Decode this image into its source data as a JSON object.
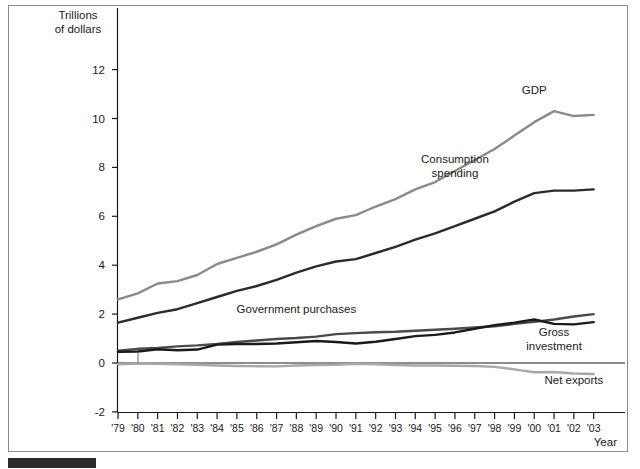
{
  "figure": {
    "axis_title_line1": "Trillions",
    "axis_title_line2": "of dollars",
    "xlabel": "Year",
    "frame_color": "#8c8c8c",
    "source_bar_color": "#2b2b2b"
  },
  "chart_data": {
    "type": "line",
    "title": "",
    "subtitle": "",
    "xlabel": "Year",
    "ylabel": "Trillions of dollars",
    "ylim": [
      -2,
      13
    ],
    "xlim": [
      "'79",
      "'03"
    ],
    "ytick_labels": [
      "12",
      "10",
      "8",
      "6",
      "4",
      "2",
      "0",
      "-2"
    ],
    "ytick_values": [
      12,
      10,
      8,
      6,
      4,
      2,
      0,
      -2
    ],
    "grid": false,
    "legend": "inline-annotations",
    "x": [
      "'79",
      "'80",
      "'81",
      "'82",
      "'83",
      "'84",
      "'85",
      "'86",
      "'87",
      "'88",
      "'89",
      "'90",
      "'91",
      "'92",
      "'93",
      "'94",
      "'95",
      "'96",
      "'97",
      "'98",
      "'99",
      "'00",
      "'01",
      "'02",
      "'03"
    ],
    "series": [
      {
        "name": "GDP",
        "color": "#8a8a8a",
        "label": "GDP",
        "values": [
          2.6,
          2.85,
          3.25,
          3.35,
          3.6,
          4.05,
          4.3,
          4.55,
          4.85,
          5.25,
          5.6,
          5.9,
          6.05,
          6.4,
          6.7,
          7.1,
          7.4,
          7.85,
          8.3,
          8.75,
          9.3,
          9.85,
          10.3,
          10.1,
          10.15
        ],
        "units": "trillions of dollars"
      },
      {
        "name": "Consumption spending",
        "color": "#2b2b2b",
        "label": "Consumption\nspending",
        "values": [
          1.65,
          1.85,
          2.05,
          2.2,
          2.45,
          2.7,
          2.95,
          3.15,
          3.4,
          3.7,
          3.95,
          4.15,
          4.25,
          4.5,
          4.75,
          5.05,
          5.3,
          5.6,
          5.9,
          6.2,
          6.6,
          6.95,
          7.05,
          7.05,
          7.1
        ]
      },
      {
        "name": "Government purchases",
        "color": "#4a4a4a",
        "label": "Government purchases",
        "values": [
          0.5,
          0.58,
          0.62,
          0.68,
          0.72,
          0.78,
          0.86,
          0.92,
          0.98,
          1.02,
          1.08,
          1.18,
          1.22,
          1.26,
          1.28,
          1.32,
          1.36,
          1.4,
          1.45,
          1.5,
          1.6,
          1.68,
          1.78,
          1.9,
          2.0
        ]
      },
      {
        "name": "Gross investment",
        "color": "#1a1a1a",
        "label": "Gross\ninvestment",
        "values": [
          0.46,
          0.47,
          0.56,
          0.52,
          0.55,
          0.75,
          0.78,
          0.78,
          0.8,
          0.85,
          0.9,
          0.86,
          0.8,
          0.87,
          0.98,
          1.1,
          1.15,
          1.25,
          1.4,
          1.55,
          1.65,
          1.78,
          1.6,
          1.58,
          1.67
        ]
      },
      {
        "name": "Net exports",
        "color": "#a8a8a8",
        "label": "Net exports",
        "values": [
          -0.05,
          -0.02,
          -0.03,
          -0.05,
          -0.07,
          -0.1,
          -0.12,
          -0.13,
          -0.14,
          -0.1,
          -0.08,
          -0.07,
          -0.03,
          -0.05,
          -0.08,
          -0.1,
          -0.1,
          -0.11,
          -0.12,
          -0.16,
          -0.26,
          -0.38,
          -0.37,
          -0.43,
          -0.45
        ]
      }
    ],
    "annotations": [
      {
        "text": "GDP",
        "x": "'00",
        "y": 11.0
      },
      {
        "text": "Consumption spending",
        "x": "'96",
        "y": 8.2
      },
      {
        "text": "Government purchases",
        "x": "'88",
        "y": 2.05
      },
      {
        "text": "Gross investment",
        "x": "'01",
        "y": 1.1
      },
      {
        "text": "Net exports",
        "x": "'02",
        "y": -0.85
      }
    ]
  }
}
